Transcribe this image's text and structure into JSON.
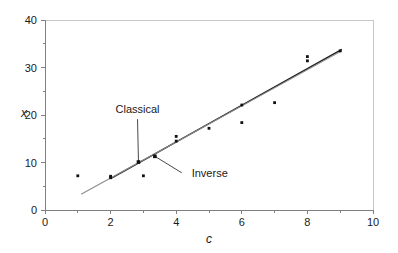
{
  "chart_data": {
    "type": "scatter",
    "title": "",
    "xlabel": "c",
    "ylabel": "x",
    "xlim": [
      0,
      10
    ],
    "ylim": [
      0,
      40
    ],
    "grid": false,
    "legend_position": "none",
    "x_ticks": [
      "0",
      "2",
      "4",
      "6",
      "8",
      "10"
    ],
    "x_tick_values": [
      0,
      2,
      4,
      6,
      8,
      10
    ],
    "x_minor_tick_values": [
      1,
      3,
      5,
      7,
      9
    ],
    "y_ticks": [
      "0",
      "10",
      "20",
      "30",
      "40"
    ],
    "y_tick_values": [
      0,
      10,
      20,
      30,
      40
    ],
    "y_minor_tick_values": [
      5,
      15,
      25,
      35
    ],
    "points": [
      {
        "c": 1,
        "x": 7.2
      },
      {
        "c": 2,
        "x": 6.8
      },
      {
        "c": 2,
        "x": 7.1
      },
      {
        "c": 3,
        "x": 7.2
      },
      {
        "c": 4,
        "x": 14.5
      },
      {
        "c": 4,
        "x": 15.5
      },
      {
        "c": 5,
        "x": 17.2
      },
      {
        "c": 6,
        "x": 18.4
      },
      {
        "c": 6,
        "x": 22.1
      },
      {
        "c": 7,
        "x": 22.6
      },
      {
        "c": 8,
        "x": 31.4
      },
      {
        "c": 8,
        "x": 32.3
      },
      {
        "c": 9,
        "x": 33.5
      }
    ],
    "series": [
      {
        "name": "Classical",
        "type": "line",
        "color": "#222222",
        "x": [
          2.0,
          9.05
        ],
        "values": [
          6.6,
          33.8
        ]
      },
      {
        "name": "Inverse",
        "type": "line",
        "color": "#8c8c8c",
        "x": [
          1.1,
          9.05
        ],
        "values": [
          3.3,
          33.5
        ]
      }
    ],
    "annotations": [
      {
        "label": "Classical",
        "label_x": 2.15,
        "label_y": 20.4,
        "target_c": 2.85,
        "target_x": 10.1
      },
      {
        "label": "Inverse",
        "label_x": 4.35,
        "label_y": 7.0,
        "target_c": 3.35,
        "target_x": 11.3
      }
    ]
  }
}
